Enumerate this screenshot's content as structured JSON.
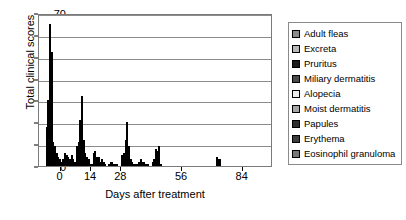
{
  "chart_data": {
    "type": "bar",
    "title": "",
    "xlabel": "Days after treatment",
    "ylabel": "Total clinical scores",
    "ylim": [
      0,
      70
    ],
    "ytick_step": 10,
    "yticks": [
      0,
      10,
      20,
      30,
      40,
      50,
      60,
      70
    ],
    "xticks": [
      0,
      14,
      28,
      56,
      84
    ],
    "xlim": [
      -10,
      98
    ],
    "grid": true,
    "legend_position": "right",
    "categories": [
      -7,
      0,
      7,
      14,
      21,
      28,
      35,
      42,
      49,
      56,
      70,
      84,
      98
    ],
    "series": [
      {
        "name": "Adult fleas",
        "color": "#8c8c8c",
        "values": [
          18,
          2,
          9,
          1,
          0,
          5,
          1,
          2,
          0,
          0,
          0,
          0,
          0
        ]
      },
      {
        "name": "Excreta",
        "color": "#b8b8b8",
        "values": [
          30,
          3,
          11,
          6,
          1,
          6,
          2,
          3,
          0,
          0,
          0,
          0,
          0
        ]
      },
      {
        "name": "Pruritus",
        "color": "#1c1c1c",
        "values": [
          65,
          6,
          21,
          7,
          2,
          12,
          3,
          8,
          0,
          0,
          4,
          0,
          0
        ]
      },
      {
        "name": "Miliary dermatitis",
        "color": "#4a4a4a",
        "values": [
          52,
          5,
          32,
          4,
          2,
          20,
          2,
          7,
          0,
          0,
          3,
          0,
          0
        ]
      },
      {
        "name": "Alopecia",
        "color": "#ededed",
        "values": [
          11,
          4,
          12,
          4,
          1,
          9,
          2,
          9,
          0,
          0,
          3,
          0,
          0
        ]
      },
      {
        "name": "Moist dermatitis",
        "color": "#a6a6a6",
        "values": [
          9,
          3,
          6,
          2,
          1,
          3,
          1,
          1,
          0,
          0,
          0,
          0,
          0
        ]
      },
      {
        "name": "Papules",
        "color": "#2e2e2e",
        "values": [
          6,
          5,
          4,
          3,
          1,
          2,
          1,
          0,
          0,
          0,
          0,
          0,
          0
        ]
      },
      {
        "name": "Erythema",
        "color": "#3d3d3d",
        "values": [
          4,
          3,
          3,
          2,
          0,
          1,
          0,
          0,
          0,
          0,
          0,
          0,
          0
        ]
      },
      {
        "name": "Eosinophil granuloma",
        "color": "#787878",
        "values": [
          3,
          2,
          1,
          1,
          0,
          1,
          0,
          0,
          0,
          0,
          0,
          0,
          0
        ]
      }
    ]
  },
  "axes": {
    "y_title": "Total clinical scores",
    "x_title": "Days after treatment",
    "y_tick_labels": [
      "70",
      "60",
      "50",
      "40",
      "30",
      "20",
      "10",
      "0"
    ],
    "x_tick_labels": [
      "0",
      "14",
      "28",
      "56",
      "84"
    ]
  },
  "legend": {
    "items": [
      {
        "label": "Adult fleas",
        "color": "#8c8c8c"
      },
      {
        "label": "Excreta",
        "color": "#b8b8b8"
      },
      {
        "label": "Pruritus",
        "color": "#1c1c1c"
      },
      {
        "label": "Miliary dermatitis",
        "color": "#4a4a4a"
      },
      {
        "label": "Alopecia",
        "color": "#ededed"
      },
      {
        "label": "Moist dermatitis",
        "color": "#a6a6a6"
      },
      {
        "label": "Papules",
        "color": "#2e2e2e"
      },
      {
        "label": "Erythema",
        "color": "#3d3d3d"
      },
      {
        "label": "Eosinophil granuloma",
        "color": "#787878"
      }
    ]
  }
}
